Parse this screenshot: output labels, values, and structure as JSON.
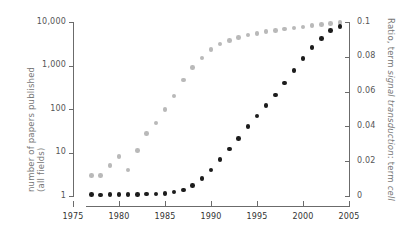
{
  "chart_data": {
    "type": "scatter",
    "title": "",
    "xlabel": "",
    "ylabel": "number of papers published (all fields)",
    "y2label_parts": {
      "a": "Ratio, term ",
      "b": "signal transduction",
      "c": ": term ",
      "d": "cell"
    },
    "y2label": "Ratio, term signal transduction: term cell",
    "xlim": [
      1975,
      2005
    ],
    "xticks": [
      1975,
      1980,
      1985,
      1990,
      1995,
      2000,
      2005
    ],
    "xticklabels": [
      "1975",
      "1980",
      "1985",
      "1990",
      "1995",
      "2000",
      "2005"
    ],
    "yscale": "log",
    "ylim": [
      1,
      10000
    ],
    "yticks": [
      1,
      10,
      100,
      1000,
      10000
    ],
    "yticklabels": [
      "1",
      "10",
      "100",
      "1,000",
      "10,000"
    ],
    "y2lim": [
      0,
      0.1
    ],
    "y2ticks": [
      0,
      0.02,
      0.04,
      0.06,
      0.08,
      0.1
    ],
    "y2ticklabels": [
      "0",
      "0.02",
      "0.04",
      "0.06",
      "0.08",
      "0.1"
    ],
    "grid": false,
    "legend": "none",
    "colors": {
      "series_papers": "#b9b9b9",
      "series_ratio": "#1c1c1c",
      "axis": "#6b6b6b",
      "text": "#555555"
    },
    "series": [
      {
        "name": "number of papers published (all fields)",
        "axis": "left",
        "marker": "circle",
        "color": "#b9b9b9",
        "x": [
          1977,
          1978,
          1979,
          1980,
          1981,
          1982,
          1983,
          1984,
          1985,
          1986,
          1987,
          1988,
          1989,
          1990,
          1991,
          1992,
          1993,
          1994,
          1995,
          1996,
          1997,
          1998,
          1999,
          2000,
          2001,
          2002,
          2003,
          2004
        ],
        "values": [
          3,
          3,
          5,
          8,
          4,
          11,
          27,
          48,
          98,
          200,
          460,
          900,
          1500,
          2300,
          3100,
          3800,
          4400,
          5000,
          5500,
          6000,
          6400,
          6900,
          7300,
          7700,
          8200,
          8700,
          9300,
          9800
        ]
      },
      {
        "name": "Ratio, term signal transduction: term cell",
        "axis": "right",
        "marker": "circle",
        "color": "#1c1c1c",
        "x": [
          1977,
          1978,
          1979,
          1980,
          1981,
          1982,
          1983,
          1984,
          1985,
          1986,
          1987,
          1988,
          1989,
          1990,
          1991,
          1992,
          1993,
          1994,
          1995,
          1996,
          1997,
          1998,
          1999,
          2000,
          2001,
          2002,
          2003,
          2004
        ],
        "values": [
          0.0008,
          0.0006,
          0.0008,
          0.0009,
          0.0009,
          0.001,
          0.0011,
          0.0012,
          0.0016,
          0.0022,
          0.0035,
          0.006,
          0.01,
          0.015,
          0.021,
          0.027,
          0.033,
          0.04,
          0.046,
          0.052,
          0.058,
          0.065,
          0.072,
          0.079,
          0.0855,
          0.0905,
          0.095,
          0.0975
        ]
      }
    ]
  }
}
